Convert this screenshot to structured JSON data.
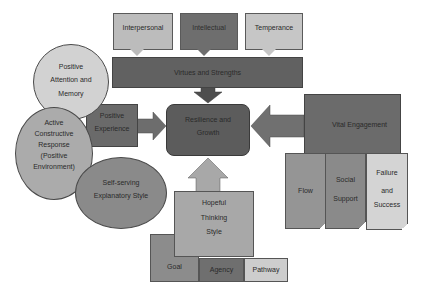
{
  "diagram": {
    "top_callouts": [
      {
        "label": "Interpersonal",
        "color": "#bcbcbc"
      },
      {
        "label": "Intellectual",
        "color": "#6e6e6e"
      },
      {
        "label": "Temperance",
        "color": "#c6c6c6"
      }
    ],
    "virtues_bar": {
      "label": "Virtues and Strengths",
      "color": "#616161"
    },
    "center": {
      "label_line1": "Resilience and",
      "label_line2": "Growth",
      "color": "#5c5c5c"
    },
    "left_circles": [
      {
        "line1": "Positive",
        "line2": "Attention and",
        "line3": "Memory",
        "color": "#d2d2d2"
      },
      {
        "line1": "Active",
        "line2": "Constructive",
        "line3": "Response",
        "line4": "(Positive",
        "line5": "Environment)",
        "color": "#ababab"
      },
      {
        "line1": "Self-serving",
        "line2": "Explanatory Style",
        "color": "#8a8a8a"
      }
    ],
    "positive_experience": {
      "line1": "Positive",
      "line2": "Experience",
      "color": "#6a6a6a"
    },
    "vital_engagement": {
      "label": "Vital Engagement",
      "color": "#6b6b6b"
    },
    "engagement_docs": [
      {
        "line1": "Flow",
        "color": "#959595"
      },
      {
        "line1": "Social",
        "line2": "Support",
        "color": "#8a8a8a"
      },
      {
        "line1": "Failure",
        "line2": "and",
        "line3": "Success",
        "color": "#d4d4d4"
      }
    ],
    "hopeful": {
      "line1": "Hopeful",
      "line2": "Thinking",
      "line3": "Style",
      "color": "#a8a8a8"
    },
    "hope_components": [
      {
        "label": "Goal",
        "color": "#8c8c8c"
      },
      {
        "label": "Agency",
        "color": "#6f6f6f"
      },
      {
        "label": "Pathway",
        "color": "#cdcdcd"
      }
    ]
  }
}
